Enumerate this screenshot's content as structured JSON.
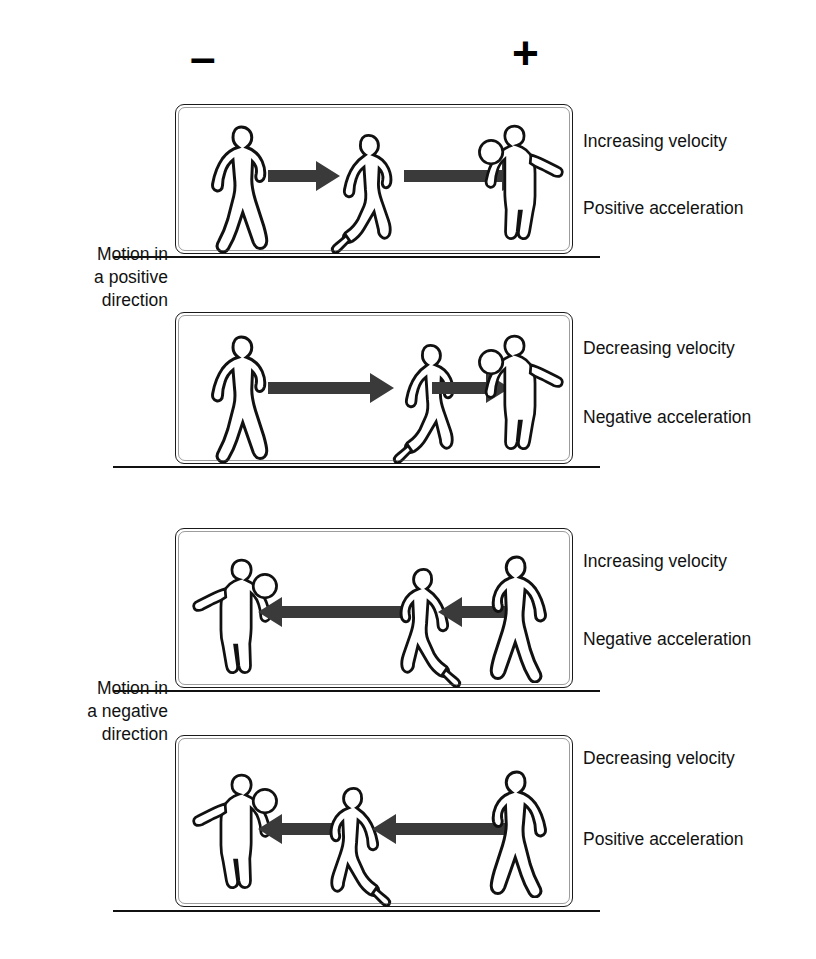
{
  "diagram": {
    "axis_signs": {
      "negative_sign": "–",
      "positive_sign": "+"
    },
    "side_captions": [
      {
        "id": "motion-positive",
        "lines": [
          "Motion in",
          "a positive",
          "direction"
        ]
      },
      {
        "id": "motion-negative",
        "lines": [
          "Motion in",
          "a negative",
          "direction"
        ]
      }
    ],
    "panels": [
      {
        "id": "panel-1",
        "velocity_label": "Increasing velocity",
        "acceleration_label": "Positive acceleration",
        "direction": "right",
        "arrow_trend": "lengthening",
        "figures": [
          "walking-figure",
          "running-figure",
          "throwing-figure"
        ]
      },
      {
        "id": "panel-2",
        "velocity_label": "Decreasing velocity",
        "acceleration_label": "Negative acceleration",
        "direction": "right",
        "arrow_trend": "shortening",
        "figures": [
          "walking-figure",
          "running-figure",
          "throwing-figure"
        ]
      },
      {
        "id": "panel-3",
        "velocity_label": "Increasing velocity",
        "acceleration_label": "Negative acceleration",
        "direction": "left",
        "arrow_trend": "lengthening",
        "figures": [
          "throwing-figure",
          "running-figure",
          "walking-figure"
        ]
      },
      {
        "id": "panel-4",
        "velocity_label": "Decreasing velocity",
        "acceleration_label": "Positive acceleration",
        "direction": "left",
        "arrow_trend": "shortening",
        "figures": [
          "throwing-figure",
          "running-figure",
          "walking-figure"
        ]
      }
    ],
    "colors": {
      "ink": "#111111",
      "arrow_fill": "#3a3a3a",
      "panel_border": "#1a1a1a",
      "background": "#ffffff"
    }
  }
}
